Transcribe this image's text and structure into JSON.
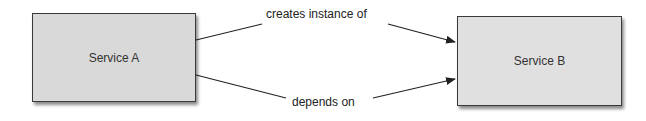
{
  "nodes": [
    {
      "id": "service-a",
      "label": "Service A"
    },
    {
      "id": "service-b",
      "label": "Service B"
    }
  ],
  "edges": [
    {
      "from": "service-a",
      "to": "service-b",
      "label": "creates instance of"
    },
    {
      "from": "service-a",
      "to": "service-b",
      "label": "depends on"
    }
  ],
  "colors": {
    "box_fill": "#d9d9d9",
    "box_border": "#3a3a3a",
    "line": "#222222"
  }
}
